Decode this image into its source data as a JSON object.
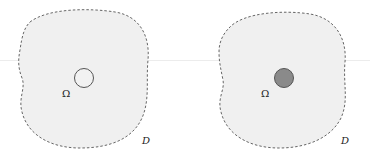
{
  "figure": {
    "panels": [
      {
        "id": "left",
        "domain_label": "D",
        "inclusion_label": "Ω",
        "inclusion_style": "empty",
        "inclusion_fill": "#f2f2f2",
        "inclusion_stroke": "#555555"
      },
      {
        "id": "right",
        "domain_label": "D",
        "inclusion_label": "Ω",
        "inclusion_style": "filled",
        "inclusion_fill": "#8a8a8a",
        "inclusion_stroke": "#555555"
      }
    ],
    "colors": {
      "domain_fill": "#f0f0f0",
      "domain_stroke": "#666666",
      "label": "#222222"
    }
  }
}
